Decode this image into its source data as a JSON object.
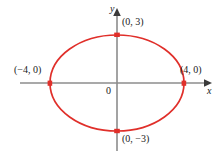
{
  "figure": {
    "background": "#ffffff"
  },
  "axes": {
    "x_axis_label": "x",
    "y_axis_label": "y",
    "origin_label": "0",
    "axis_color": "#8c8c8c",
    "arrow_color": "#3a3a3a",
    "x_axis_start_px": 20,
    "x_axis_end_px": 212,
    "y_axis_start_px": 8,
    "y_axis_end_px": 151,
    "origin_px": {
      "x": 117,
      "y": 83
    }
  },
  "curve": {
    "type": "ellipse",
    "color": "#e02f2a",
    "stroke_width": 1.6,
    "center": {
      "x": 0,
      "y": 0
    },
    "semi_major_axis_a": 4,
    "semi_minor_axis_b": 3,
    "equation": "x^2/16 + y^2/9 = 1",
    "center_px": {
      "x": 117,
      "y": 83
    },
    "radius_x_px": 67,
    "radius_y_px": 48
  },
  "points": [
    {
      "id": "vertex-top",
      "label": "(0, 3)",
      "x": 0,
      "y": 3,
      "px": {
        "x": 117,
        "y": 35
      },
      "color": "#e02f2a"
    },
    {
      "id": "vertex-bottom",
      "label": "(0, −3)",
      "x": 0,
      "y": -3,
      "px": {
        "x": 117,
        "y": 131
      },
      "color": "#e02f2a"
    },
    {
      "id": "vertex-left",
      "label": "(−4, 0)",
      "x": -4,
      "y": 0,
      "px": {
        "x": 50,
        "y": 83
      },
      "color": "#e02f2a"
    },
    {
      "id": "vertex-right",
      "label": "(4, 0)",
      "x": 4,
      "y": 0,
      "px": {
        "x": 184,
        "y": 83
      },
      "color": "#e02f2a"
    }
  ]
}
